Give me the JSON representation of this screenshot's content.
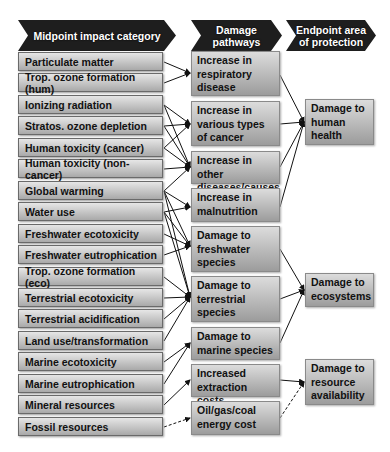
{
  "headers": {
    "midpoint": "Midpoint impact category",
    "pathways_line1": "Damage",
    "pathways_line2": "pathways",
    "endpoint_line1": "Endpoint area",
    "endpoint_line2": "of protection"
  },
  "midpoints": [
    "Particulate matter",
    "Trop. ozone formation (hum)",
    "Ionizing radiation",
    "Stratos. ozone depletion",
    "Human toxicity (cancer)",
    "Human toxicity (non-cancer)",
    "Global warming",
    "Water use",
    "Freshwater ecotoxicity",
    "Freshwater eutrophication",
    "Trop. ozone formation (eco)",
    "Terrestrial ecotoxicity",
    "Terrestrial acidification",
    "Land use/transformation",
    "Marine ecotoxicity",
    "Marine eutrophication",
    "Mineral resources",
    "Fossil resources"
  ],
  "pathways": [
    "Increase in respiratory disease",
    "Increase in various types of cancer",
    "Increase in other diseases/causes",
    "Increase in malnutrition",
    "Damage to freshwater species",
    "Damage to terrestrial species",
    "Damage to marine species",
    "Increased extraction costs",
    "Oil/gas/coal energy cost"
  ],
  "endpoints": [
    "Damage to human health",
    "Damage to ecosystems",
    "Damage to resource availability"
  ],
  "colors": {
    "header_bg": "#1e1e1e",
    "box_top": "#e6e6e6",
    "box_bottom": "#a9a9a9",
    "line": "#111111"
  }
}
